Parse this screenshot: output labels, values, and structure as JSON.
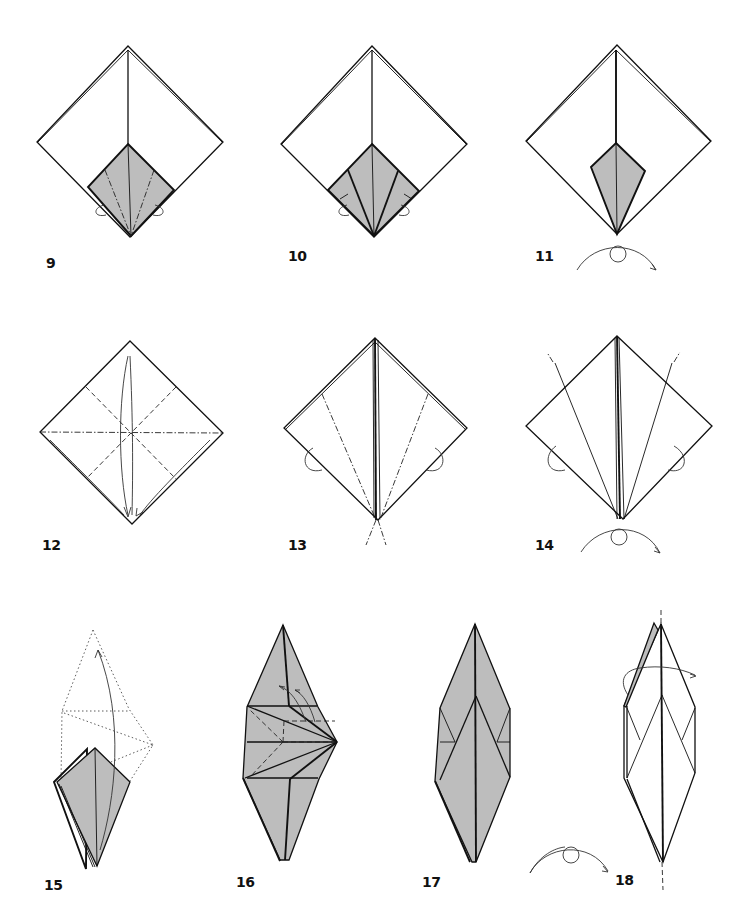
{
  "page": {
    "type": "origami-instructions",
    "fill_color": "#bdbdbd",
    "line_color": "#111111",
    "background": "#ffffff"
  },
  "steps": [
    {
      "number": "9",
      "label_pos": [
        46,
        270
      ],
      "description": "Square base with colored kite section; mountain-fold lines and reverse-fold arrows on both sides"
    },
    {
      "number": "10",
      "label_pos": [
        288,
        262
      ],
      "description": "Sides folded in along the colored kite; reverse-fold arrows"
    },
    {
      "number": "11",
      "label_pos": [
        535,
        262
      ],
      "description": "Narrow colored kite; turn over symbol"
    },
    {
      "number": "12",
      "label_pos": [
        42,
        552
      ],
      "description": "Square with valley and mountain crease lines; fold arrows toward bottom"
    },
    {
      "number": "13",
      "label_pos": [
        288,
        550
      ],
      "description": "Diamond with mountain fold lines converging at bottom; reverse-fold arrows"
    },
    {
      "number": "14",
      "label_pos": [
        535,
        550
      ],
      "description": "Diamond with folded flaps; turn over symbol"
    },
    {
      "number": "15",
      "label_pos": [
        44,
        890
      ],
      "description": "Kite with dotted outline of petal fold; arrow lifting flap up"
    },
    {
      "number": "16",
      "label_pos": [
        236,
        886
      ],
      "description": "Petal fold in progress with valley fold lines and arrows"
    },
    {
      "number": "17",
      "label_pos": [
        422,
        886
      ],
      "description": "Long diamond shape, colored"
    },
    {
      "number": "18",
      "label_pos": [
        615,
        884
      ],
      "description": "Long diamond outline with vertical fold axis and flip arrow; turn over symbol"
    }
  ],
  "symbols": {
    "turn_over": "turn-over-symbol",
    "reverse_fold": "reverse-fold-arrow",
    "valley_fold": "dashed line",
    "mountain_fold": "dash-dot line"
  }
}
